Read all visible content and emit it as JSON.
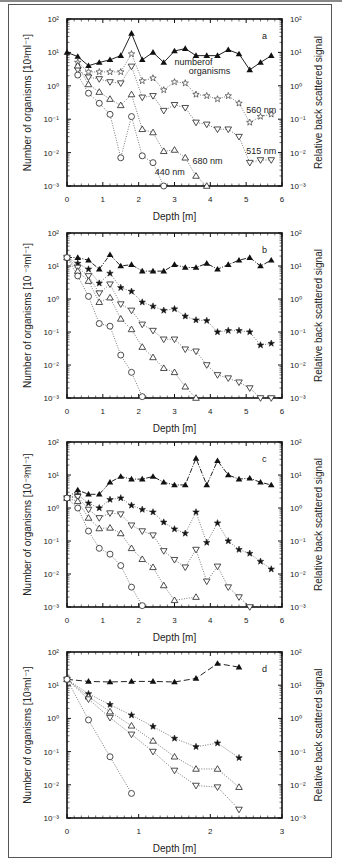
{
  "chart_data": [
    {
      "panel": "a",
      "type": "line",
      "xlabel": "Depth [m]",
      "ylabel": "Number of organisms [10^3 ml^-1]",
      "ylabel_right": "Relative back scattered signal",
      "xlim": [
        0,
        6
      ],
      "xticks": [
        0,
        1,
        2,
        3,
        4,
        5,
        6
      ],
      "ylim": [
        0.001,
        100
      ],
      "yscale": "log",
      "annotations": [
        "numberof organisms",
        "560 nm",
        "515 nm",
        "680 nm",
        "440 nm"
      ],
      "series": [
        {
          "name": "number of organisms",
          "marker": "filled-triangle",
          "x": [
            0,
            0.3,
            0.6,
            0.9,
            1.2,
            1.5,
            1.8,
            2.1,
            2.4,
            2.7,
            3.0,
            3.3,
            3.6,
            3.9,
            4.2,
            4.5,
            4.8,
            5.1,
            5.4,
            5.7
          ],
          "values": [
            10,
            7.5,
            4,
            5,
            6,
            8,
            37,
            6,
            10,
            5,
            11,
            13,
            8,
            8,
            8,
            12,
            9,
            3,
            5,
            8
          ]
        },
        {
          "name": "560 nm",
          "marker": "open-star",
          "x": [
            0.3,
            0.6,
            0.9,
            1.2,
            1.5,
            1.8,
            2.1,
            2.4,
            2.7,
            3.0,
            3.3,
            3.6,
            3.9,
            4.2,
            4.5,
            4.8,
            5.1,
            5.4,
            5.7
          ],
          "values": [
            5,
            2.6,
            2.6,
            2.6,
            2.6,
            9,
            1.4,
            1.7,
            0.75,
            1.3,
            1.2,
            0.55,
            0.5,
            0.4,
            0.5,
            0.3,
            0.08,
            0.12,
            0.14
          ]
        },
        {
          "name": "515 nm",
          "marker": "open-down-triangle",
          "x": [
            0.3,
            0.6,
            0.9,
            1.2,
            1.5,
            1.8,
            2.1,
            2.4,
            2.7,
            3.0,
            3.3,
            3.6,
            3.9,
            4.2,
            4.5,
            4.8,
            5.1,
            5.4,
            5.7
          ],
          "values": [
            3,
            1.8,
            1.6,
            1.3,
            1.2,
            3.8,
            0.45,
            0.5,
            0.18,
            0.27,
            0.22,
            0.08,
            0.07,
            0.05,
            0.05,
            0.03,
            0.005,
            0.006,
            0.006
          ]
        },
        {
          "name": "680 nm",
          "marker": "open-triangle",
          "x": [
            0.3,
            0.6,
            0.9,
            1.2,
            1.5,
            1.8,
            2.1,
            2.4,
            2.7,
            3.0,
            3.3,
            3.6,
            3.9
          ],
          "values": [
            4,
            1.1,
            0.65,
            0.4,
            0.26,
            0.55,
            0.05,
            0.04,
            0.011,
            0.012,
            0.007,
            0.002,
            0.001
          ]
        },
        {
          "name": "440 nm",
          "marker": "open-circle",
          "x": [
            0.3,
            0.6,
            0.9,
            1.2,
            1.5,
            1.8,
            2.1,
            2.4,
            2.7
          ],
          "values": [
            2.1,
            0.6,
            0.3,
            0.14,
            0.007,
            0.12,
            0.008,
            0.005,
            0.001
          ]
        }
      ]
    },
    {
      "panel": "b",
      "type": "line",
      "xlabel": "Depth [m]",
      "ylabel": "Number of organisms [10^-3 ml^-1]",
      "ylabel_right": "Relative back scattered signal",
      "xlim": [
        0,
        6
      ],
      "xticks": [
        0,
        1,
        2,
        3,
        4,
        5,
        6
      ],
      "ylim": [
        0.001,
        100
      ],
      "yscale": "log",
      "series": [
        {
          "name": "number of organisms",
          "marker": "filled-triangle",
          "x": [
            0,
            0.3,
            0.6,
            0.9,
            1.2,
            1.5,
            1.8,
            2.1,
            2.4,
            2.7,
            3.0,
            3.3,
            3.6,
            3.9,
            4.2,
            4.5,
            4.8,
            5.1,
            5.4,
            5.7
          ],
          "values": [
            18,
            18,
            15,
            8,
            22,
            10,
            11,
            7,
            7,
            7,
            11,
            9,
            9,
            12,
            8,
            11,
            15,
            18,
            10,
            15
          ]
        },
        {
          "name": "560 nm",
          "marker": "filled-star",
          "x": [
            0,
            0.3,
            0.6,
            0.9,
            1.2,
            1.5,
            1.8,
            2.1,
            2.4,
            2.7,
            3.0,
            3.3,
            3.6,
            3.9,
            4.2,
            4.5,
            4.8,
            5.1,
            5.4,
            5.7
          ],
          "values": [
            18,
            12,
            8,
            3,
            6,
            2.2,
            1.7,
            0.8,
            0.6,
            0.45,
            0.5,
            0.3,
            0.23,
            0.22,
            0.1,
            0.11,
            0.11,
            0.1,
            0.04,
            0.045
          ]
        },
        {
          "name": "515 nm",
          "marker": "open-down-triangle",
          "x": [
            0,
            0.3,
            0.6,
            0.9,
            1.2,
            1.5,
            1.8,
            2.1,
            2.4,
            2.7,
            3.0,
            3.3,
            3.6,
            3.9,
            4.2,
            4.5,
            4.8,
            5.1,
            5.4,
            5.7
          ],
          "values": [
            18,
            9,
            5,
            1.5,
            2.8,
            0.7,
            0.45,
            0.17,
            0.11,
            0.06,
            0.06,
            0.03,
            0.026,
            0.01,
            0.005,
            0.004,
            0.003,
            0.002,
            0.001,
            0.001
          ]
        },
        {
          "name": "680 nm",
          "marker": "open-triangle",
          "x": [
            0,
            0.3,
            0.6,
            0.9,
            1.2,
            1.5,
            1.8,
            2.1,
            2.4,
            2.7,
            3.0,
            3.3,
            3.6
          ],
          "values": [
            18,
            7,
            3.5,
            0.8,
            1.1,
            0.25,
            0.12,
            0.035,
            0.017,
            0.008,
            0.006,
            0.0022,
            0.001
          ]
        },
        {
          "name": "440 nm",
          "marker": "open-circle",
          "x": [
            0,
            0.3,
            0.6,
            0.9,
            1.2,
            1.5,
            1.8,
            2.1
          ],
          "values": [
            18,
            5,
            1.2,
            0.18,
            0.15,
            0.02,
            0.006,
            0.0011
          ]
        }
      ]
    },
    {
      "panel": "c",
      "type": "line",
      "xlabel": "Depth [m]",
      "ylabel": "Number of organisms [10^-3 ml^-1]",
      "ylabel_right": "Relative back scattered signal",
      "xlim": [
        0,
        6
      ],
      "xticks": [
        0,
        1,
        2,
        3,
        4,
        5,
        6
      ],
      "ylim": [
        0.001,
        100
      ],
      "yscale": "log",
      "series": [
        {
          "name": "number of organisms",
          "marker": "filled-triangle",
          "x": [
            0,
            0.3,
            0.6,
            0.9,
            1.2,
            1.5,
            1.8,
            2.1,
            2.4,
            2.7,
            3.0,
            3.3,
            3.6,
            3.9,
            4.2,
            4.5,
            4.8,
            5.1,
            5.4,
            5.7
          ],
          "values": [
            2,
            3.5,
            2.6,
            2.6,
            6,
            9,
            7.5,
            7.5,
            9,
            6,
            5,
            5,
            32,
            5,
            27,
            10,
            7.5,
            8,
            6,
            5
          ]
        },
        {
          "name": "560 nm",
          "marker": "filled-star",
          "x": [
            0,
            0.3,
            0.6,
            0.9,
            1.2,
            1.5,
            1.8,
            2.1,
            2.4,
            2.7,
            3.0,
            3.3,
            3.6,
            3.9,
            4.2,
            4.5,
            4.8,
            5.1,
            5.4,
            5.7
          ],
          "values": [
            2,
            2.5,
            1.4,
            1,
            1.8,
            2,
            1.2,
            0.9,
            0.75,
            0.37,
            0.23,
            0.17,
            0.75,
            0.09,
            0.35,
            0.1,
            0.055,
            0.042,
            0.024,
            0.014
          ]
        },
        {
          "name": "515 nm",
          "marker": "open-down-triangle",
          "x": [
            0,
            0.3,
            0.6,
            0.9,
            1.2,
            1.5,
            1.8,
            2.1,
            2.4,
            2.7,
            3.0,
            3.3,
            3.6,
            3.9,
            4.2,
            4.5,
            4.8,
            5.1
          ],
          "values": [
            2,
            2.2,
            0.9,
            0.5,
            0.7,
            0.65,
            0.3,
            0.2,
            0.15,
            0.05,
            0.027,
            0.016,
            0.055,
            0.006,
            0.017,
            0.004,
            0.002,
            0.001
          ]
        },
        {
          "name": "680 nm",
          "marker": "open-triangle",
          "x": [
            0,
            0.3,
            0.6,
            0.9,
            1.2,
            1.5,
            1.8,
            2.1,
            2.4,
            2.7,
            3.0,
            3.6
          ],
          "values": [
            2,
            1.6,
            0.5,
            0.24,
            0.25,
            0.17,
            0.06,
            0.028,
            0.016,
            0.0045,
            0.0016,
            0.002
          ]
        },
        {
          "name": "440 nm",
          "marker": "open-circle",
          "x": [
            0,
            0.3,
            0.6,
            0.9,
            1.2,
            1.5,
            1.8,
            2.1
          ],
          "values": [
            2,
            1,
            0.2,
            0.06,
            0.04,
            0.018,
            0.004,
            0.0011
          ]
        }
      ]
    },
    {
      "panel": "d",
      "type": "line",
      "xlabel": "Depth [m]",
      "ylabel": "Number of organisms [10^3 ml^-1]",
      "ylabel_right": "Relative back scattered signal",
      "xlim": [
        0,
        3
      ],
      "xticks": [
        0,
        1,
        2,
        3
      ],
      "ylim": [
        0.001,
        100
      ],
      "yscale": "log",
      "series": [
        {
          "name": "number of organisms",
          "marker": "filled-triangle",
          "x": [
            0,
            0.3,
            0.6,
            0.9,
            1.2,
            1.5,
            1.8,
            2.1,
            2.4
          ],
          "values": [
            15,
            13,
            12.5,
            13,
            13,
            12.5,
            16,
            45,
            35
          ]
        },
        {
          "name": "560 nm",
          "marker": "filled-star",
          "x": [
            0,
            0.3,
            0.6,
            0.9,
            1.2,
            1.5,
            1.8,
            2.1,
            2.4
          ],
          "values": [
            15,
            5.5,
            2.6,
            1.25,
            0.57,
            0.25,
            0.14,
            0.18,
            0.065
          ]
        },
        {
          "name": "680 nm",
          "marker": "open-triangle",
          "x": [
            0,
            0.3,
            0.6,
            0.9,
            1.2,
            1.5,
            1.8,
            2.1,
            2.4
          ],
          "values": [
            15,
            4.5,
            1.6,
            0.6,
            0.21,
            0.07,
            0.03,
            0.03,
            0.0085
          ]
        },
        {
          "name": "515 nm",
          "marker": "open-down-triangle",
          "x": [
            0,
            0.3,
            0.6,
            0.9,
            1.2,
            1.5,
            1.8,
            2.1,
            2.4
          ],
          "values": [
            15,
            3.8,
            1.05,
            0.33,
            0.1,
            0.027,
            0.0095,
            0.0085,
            0.0018
          ]
        },
        {
          "name": "440 nm",
          "marker": "open-circle",
          "x": [
            0,
            0.3,
            0.6,
            0.9
          ],
          "values": [
            15,
            0.9,
            0.07,
            0.0055
          ]
        }
      ]
    }
  ],
  "panels": [
    {
      "id": "a",
      "letter": "a",
      "top": 19,
      "bottom": 186,
      "xmax": 6,
      "ylabel_left": "Number of organisms [10³ml⁻¹]",
      "ylabel_right": "Relative back scattered signal",
      "xlabel": "Depth [m]"
    },
    {
      "id": "b",
      "letter": "b",
      "top": 233,
      "bottom": 398,
      "xmax": 6,
      "ylabel_left": "Number of organisms [10 ⁻³ml⁻¹]",
      "ylabel_right": "Relative back scattered signal",
      "xlabel": "Depth [m]"
    },
    {
      "id": "c",
      "letter": "c",
      "top": 442,
      "bottom": 607,
      "xmax": 6,
      "ylabel_left": "Number of organisms [10⁻³ml⁻¹]",
      "ylabel_right": "Relative back scattered signal",
      "xlabel": "Depth [m]"
    },
    {
      "id": "d",
      "letter": "d",
      "top": 652,
      "bottom": 818,
      "xmax": 3,
      "ylabel_left": "Number of organisms [10³ml⁻¹]",
      "ylabel_right": "Relative back scattered signal",
      "xlabel": "Depth [m]"
    }
  ],
  "panel_a_annotations": [
    {
      "text": "numberof",
      "x": 3.0,
      "y": 4.2
    },
    {
      "text": "organisms",
      "x": 3.4,
      "y": 2.3
    },
    {
      "text": "560 nm",
      "x": 5.0,
      "y": 0.15
    },
    {
      "text": "515 nm",
      "x": 5.0,
      "y": 0.009
    },
    {
      "text": "680 nm",
      "x": 3.5,
      "y": 0.0045
    },
    {
      "text": "440 nm",
      "x": 2.45,
      "y": 0.0021
    }
  ],
  "ytick_labels": [
    "10²",
    "10¹",
    "10⁰",
    "10⁻¹",
    "10⁻²",
    "10⁻³"
  ]
}
